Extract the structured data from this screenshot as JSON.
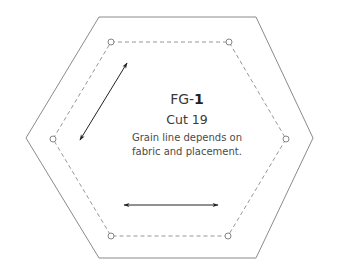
{
  "piece": {
    "code_prefix": "FG-",
    "code_number": "1",
    "cut": "Cut 19",
    "note_line1": "Grain line depends on",
    "note_line2": "fabric and placement."
  },
  "shape": {
    "type": "hexagon",
    "outer_line": "solid (cutting line)",
    "inner_line": "dashed (seam line)",
    "corner_markers": 6,
    "grain_arrows": [
      "diagonal",
      "horizontal"
    ]
  },
  "colors": {
    "outline": "#8a8a8a",
    "dashed": "#8a8a8a",
    "arrow": "#222222",
    "text": "#3a3a3a"
  }
}
